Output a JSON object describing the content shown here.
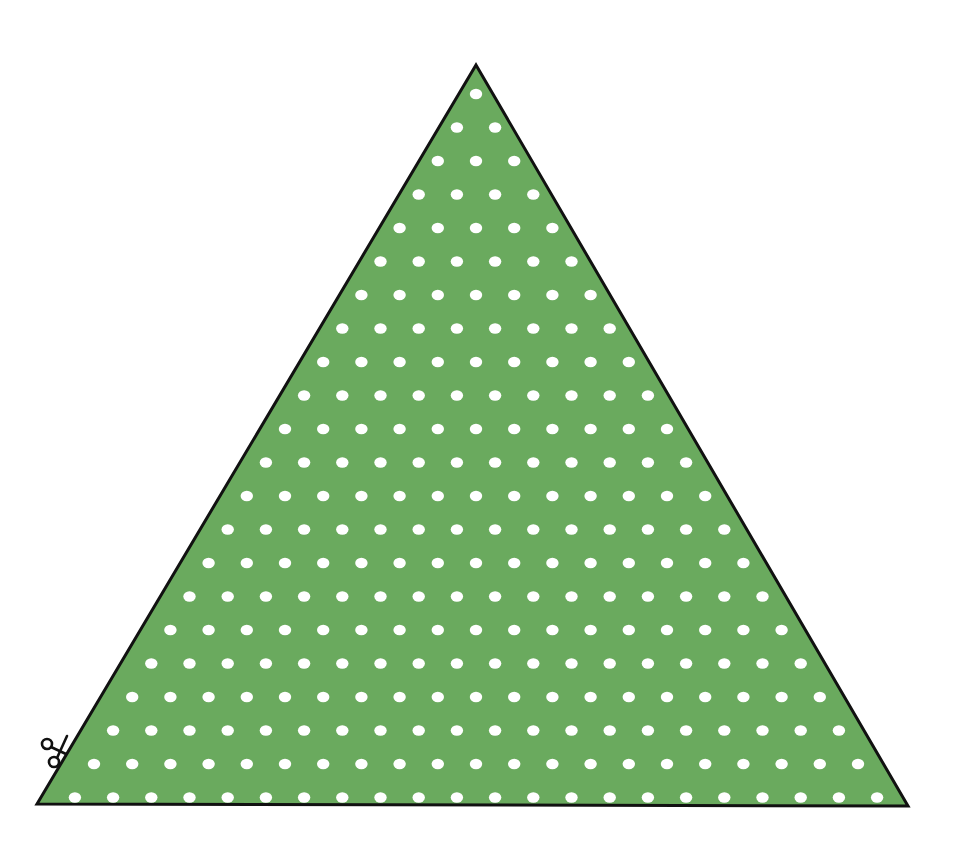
{
  "figure": {
    "colors": {
      "background": "#ffffff",
      "triangle_fill": "#6aaa5e",
      "triangle_stroke": "#111111",
      "dot": "#ffffff",
      "scissors": "#111111"
    },
    "triangle": {
      "apex": [
        476,
        65
      ],
      "bottom_left": [
        37,
        804
      ],
      "bottom_right": [
        908,
        806
      ],
      "stroke_width": 3
    },
    "dots": {
      "rows": 22,
      "first_row_y": 94,
      "row_spacing": 33.5,
      "col_spacing": 38.2,
      "center_x": 476,
      "radius_x": 6.2,
      "radius_y": 5.2,
      "dots_per_row": "row index k (1..22) contains k dots"
    },
    "scissors_icon": {
      "position": [
        56,
        748
      ],
      "label": "cut line marker"
    }
  }
}
